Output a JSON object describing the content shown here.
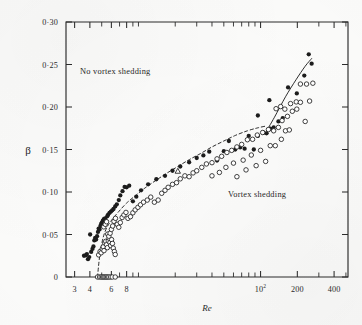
{
  "figure": {
    "background_color": "#fdfdfc",
    "ink_color": "#222222"
  },
  "annotations": {
    "no_shedding_label": "No vortex shedding",
    "shedding_label": "Vortex shedding"
  },
  "chart_data": {
    "type": "scatter",
    "title": "",
    "xlabel": "Re",
    "ylabel": "β",
    "xscale": "log",
    "yscale": "linear",
    "xlim": [
      2.55,
      520
    ],
    "ylim": [
      0,
      0.3
    ],
    "grid": false,
    "legend": "none",
    "x_ticks_labeled": [
      {
        "value": 3,
        "label": "3"
      },
      {
        "value": 4,
        "label": "4"
      },
      {
        "value": 6,
        "label": "6"
      },
      {
        "value": 8,
        "label": "8"
      },
      {
        "value": 100,
        "label": "10",
        "superscript": "2"
      },
      {
        "value": 200,
        "label": "200"
      },
      {
        "value": 400,
        "label": "400"
      }
    ],
    "x_ticks_minor": [
      3,
      4,
      5,
      6,
      7,
      8,
      9,
      10,
      20,
      30,
      40,
      50,
      60,
      70,
      80,
      90,
      100,
      200,
      300,
      400,
      500
    ],
    "y_ticks": [
      {
        "value": 0.0,
        "label": "0"
      },
      {
        "value": 0.05,
        "label": "0·05"
      },
      {
        "value": 0.1,
        "label": "0·10"
      },
      {
        "value": 0.15,
        "label": "0·15"
      },
      {
        "value": 0.2,
        "label": "0·20"
      },
      {
        "value": 0.25,
        "label": "0·25"
      },
      {
        "value": 0.3,
        "label": "0·30"
      }
    ],
    "series": [
      {
        "name": "filled-circles",
        "marker": "filled-circle",
        "color": "#1c1c1c",
        "points": [
          [
            3.58,
            0.025
          ],
          [
            3.7,
            0.0255
          ],
          [
            3.78,
            0.027
          ],
          [
            3.86,
            0.021
          ],
          [
            3.95,
            0.0235
          ],
          [
            4.02,
            0.05
          ],
          [
            4.1,
            0.0295
          ],
          [
            4.2,
            0.033
          ],
          [
            4.28,
            0.036
          ],
          [
            4.35,
            0.043
          ],
          [
            4.42,
            0.046
          ],
          [
            4.5,
            0.044
          ],
          [
            4.58,
            0.048
          ],
          [
            4.66,
            0.053
          ],
          [
            4.72,
            0.057
          ],
          [
            4.8,
            0.056
          ],
          [
            4.88,
            0.06
          ],
          [
            4.95,
            0.0625
          ],
          [
            5.02,
            0.064
          ],
          [
            5.1,
            0.066
          ],
          [
            5.2,
            0.068
          ],
          [
            5.32,
            0.069
          ],
          [
            5.45,
            0.0655
          ],
          [
            5.55,
            0.0715
          ],
          [
            5.65,
            0.0735
          ],
          [
            5.8,
            0.0755
          ],
          [
            5.95,
            0.077
          ],
          [
            6.1,
            0.0785
          ],
          [
            6.25,
            0.08
          ],
          [
            6.45,
            0.083
          ],
          [
            6.65,
            0.0855
          ],
          [
            6.9,
            0.0905
          ],
          [
            7.1,
            0.096
          ],
          [
            7.4,
            0.101
          ],
          [
            7.7,
            0.106
          ],
          [
            8.0,
            0.1055
          ],
          [
            8.4,
            0.1075
          ],
          [
            9.0,
            0.089
          ],
          [
            9.6,
            0.0945
          ],
          [
            10.5,
            0.102
          ],
          [
            12.0,
            0.109
          ],
          [
            14.0,
            0.115
          ],
          [
            16.5,
            0.119
          ],
          [
            19.0,
            0.125
          ],
          [
            22.0,
            0.13
          ],
          [
            26.0,
            0.135
          ],
          [
            30.0,
            0.14
          ],
          [
            34.0,
            0.143
          ],
          [
            38.0,
            0.1475
          ],
          [
            44.0,
            0.137
          ],
          [
            50.0,
            0.148
          ],
          [
            55.0,
            0.16
          ],
          [
            62.0,
            0.15
          ],
          [
            68.0,
            0.1525
          ],
          [
            74.0,
            0.151
          ],
          [
            80.0,
            0.166
          ],
          [
            88.0,
            0.15
          ],
          [
            95.0,
            0.166
          ],
          [
            105.0,
            0.17
          ],
          [
            112.0,
            0.169
          ],
          [
            120.0,
            0.1745
          ],
          [
            128.0,
            0.176
          ],
          [
            95.0,
            0.19
          ],
          [
            118.0,
            0.208
          ],
          [
            140.0,
            0.183
          ],
          [
            152.0,
            0.187
          ],
          [
            168.0,
            0.223
          ],
          [
            198.0,
            0.216
          ],
          [
            228.0,
            0.237
          ],
          [
            248.0,
            0.262
          ],
          [
            262.0,
            0.251
          ]
        ]
      },
      {
        "name": "open-circles",
        "marker": "open-circle",
        "color": "#1f1f1f",
        "points": [
          [
            4.62,
            0.0
          ],
          [
            4.8,
            0.0
          ],
          [
            4.95,
            0.0
          ],
          [
            5.08,
            0.0
          ],
          [
            5.2,
            0.0
          ],
          [
            5.32,
            0.0
          ],
          [
            5.45,
            0.0
          ],
          [
            5.58,
            0.0
          ],
          [
            5.72,
            0.0
          ],
          [
            5.9,
            0.0
          ],
          [
            6.1,
            0.0
          ],
          [
            6.45,
            0.0
          ],
          [
            4.72,
            0.026
          ],
          [
            4.85,
            0.03
          ],
          [
            4.95,
            0.0285
          ],
          [
            5.05,
            0.033
          ],
          [
            5.15,
            0.0355
          ],
          [
            5.22,
            0.031
          ],
          [
            5.3,
            0.04
          ],
          [
            5.4,
            0.042
          ],
          [
            5.48,
            0.038
          ],
          [
            5.56,
            0.0345
          ],
          [
            5.66,
            0.0425
          ],
          [
            5.75,
            0.0455
          ],
          [
            5.84,
            0.0405
          ],
          [
            5.92,
            0.037
          ],
          [
            6.02,
            0.044
          ],
          [
            6.12,
            0.0395
          ],
          [
            6.22,
            0.034
          ],
          [
            6.35,
            0.03
          ],
          [
            6.45,
            0.0265
          ],
          [
            5.2,
            0.059
          ],
          [
            5.35,
            0.062
          ],
          [
            5.48,
            0.065
          ],
          [
            5.6,
            0.0505
          ],
          [
            5.72,
            0.048
          ],
          [
            5.86,
            0.0515
          ],
          [
            6.0,
            0.056
          ],
          [
            6.15,
            0.06
          ],
          [
            6.3,
            0.0655
          ],
          [
            6.48,
            0.069
          ],
          [
            6.7,
            0.062
          ],
          [
            6.9,
            0.0585
          ],
          [
            7.1,
            0.064
          ],
          [
            7.35,
            0.07
          ],
          [
            7.6,
            0.073
          ],
          [
            7.9,
            0.076
          ],
          [
            8.2,
            0.069
          ],
          [
            8.6,
            0.071
          ],
          [
            9.0,
            0.0755
          ],
          [
            9.4,
            0.079
          ],
          [
            9.9,
            0.082
          ],
          [
            10.4,
            0.085
          ],
          [
            11.0,
            0.088
          ],
          [
            11.8,
            0.0905
          ],
          [
            12.6,
            0.094
          ],
          [
            13.5,
            0.088
          ],
          [
            14.5,
            0.0905
          ],
          [
            15.5,
            0.0985
          ],
          [
            16.5,
            0.102
          ],
          [
            17.5,
            0.1055
          ],
          [
            19.0,
            0.109
          ],
          [
            20.5,
            0.111
          ],
          [
            22.0,
            0.1155
          ],
          [
            24.0,
            0.119
          ],
          [
            26.0,
            0.118
          ],
          [
            28.0,
            0.1225
          ],
          [
            30.0,
            0.125
          ],
          [
            33.0,
            0.129
          ],
          [
            36.0,
            0.133
          ],
          [
            40.0,
            0.1345
          ],
          [
            44.0,
            0.139
          ],
          [
            48.0,
            0.142
          ],
          [
            53.0,
            0.1465
          ],
          [
            58.0,
            0.149
          ],
          [
            64.0,
            0.153
          ],
          [
            70.0,
            0.156
          ],
          [
            78.0,
            0.1615
          ],
          [
            86.0,
            0.162
          ],
          [
            94.0,
            0.167
          ],
          [
            104.0,
            0.17
          ],
          [
            116.0,
            0.1735
          ],
          [
            128.0,
            0.172
          ],
          [
            140.0,
            0.176
          ],
          [
            40.0,
            0.119
          ],
          [
            46.0,
            0.123
          ],
          [
            52.0,
            0.129
          ],
          [
            60.0,
            0.134
          ],
          [
            72.0,
            0.1375
          ],
          [
            84.0,
            0.1435
          ],
          [
            100.0,
            0.149
          ],
          [
            120.0,
            0.1545
          ],
          [
            64.0,
            0.118
          ],
          [
            76.0,
            0.126
          ],
          [
            92.0,
            0.131
          ],
          [
            110.0,
            0.136
          ],
          [
            132.0,
            0.1545
          ],
          [
            148.0,
            0.162
          ],
          [
            160.0,
            0.172
          ],
          [
            172.0,
            0.173
          ],
          [
            150.0,
            0.184
          ],
          [
            166.0,
            0.189
          ],
          [
            182.0,
            0.195
          ],
          [
            198.0,
            0.1975
          ],
          [
            176.0,
            0.204
          ],
          [
            196.0,
            0.206
          ],
          [
            212.0,
            0.2055
          ],
          [
            232.0,
            0.183
          ],
          [
            252.0,
            0.207
          ],
          [
            212.0,
            0.227
          ],
          [
            238.0,
            0.227
          ],
          [
            268.0,
            0.228
          ],
          [
            134.0,
            0.198
          ],
          [
            146.0,
            0.2005
          ],
          [
            158.0,
            0.1975
          ]
        ]
      },
      {
        "name": "triangle-marker",
        "marker": "open-triangle",
        "color": "#1f1f1f",
        "points": [
          [
            21.0,
            0.1245
          ]
        ]
      }
    ],
    "curves": [
      {
        "name": "stability-boundary-dashed",
        "style": "dashed",
        "points": [
          [
            4.62,
            0.0
          ],
          [
            4.75,
            0.018
          ],
          [
            4.9,
            0.032
          ],
          [
            5.15,
            0.047
          ],
          [
            5.5,
            0.058
          ],
          [
            6.0,
            0.0665
          ],
          [
            6.8,
            0.076
          ],
          [
            8.0,
            0.087
          ],
          [
            9.5,
            0.096
          ],
          [
            11.5,
            0.1055
          ],
          [
            14.0,
            0.114
          ],
          [
            17.0,
            0.122
          ],
          [
            21.0,
            0.13
          ],
          [
            26.0,
            0.138
          ],
          [
            32.0,
            0.145
          ],
          [
            40.0,
            0.153
          ],
          [
            50.0,
            0.16
          ],
          [
            62.0,
            0.1665
          ],
          [
            78.0,
            0.172
          ],
          [
            95.0,
            0.1755
          ],
          [
            110.0,
            0.1775
          ]
        ]
      },
      {
        "name": "upper-boundary-solid",
        "style": "solid",
        "points": [
          [
            108.0,
            0.168
          ],
          [
            130.0,
            0.188
          ],
          [
            160.0,
            0.212
          ],
          [
            195.0,
            0.232
          ],
          [
            232.0,
            0.248
          ],
          [
            262.0,
            0.257
          ]
        ]
      }
    ]
  }
}
